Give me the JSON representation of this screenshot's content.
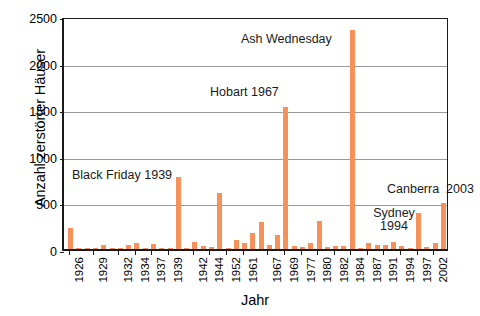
{
  "chart_data": {
    "type": "bar",
    "title": "",
    "xlabel": "Jahr",
    "ylabel": "Anzahl zerstörter Häuser",
    "ylim": [
      0,
      2500
    ],
    "ytick_values": [
      0,
      500,
      1000,
      1500,
      2000,
      2500
    ],
    "ytick_labels": [
      "0",
      "500",
      "1000",
      "1500",
      "2000",
      "2500"
    ],
    "grid": "horizontal",
    "legend": "none",
    "bar_color": "#F5915B",
    "xtick_labels": [
      "1926",
      "1929",
      "1932",
      "1934",
      "1937",
      "1939",
      "1942",
      "1944",
      "1952",
      "1961",
      "1967",
      "1969",
      "1977",
      "1980",
      "1982",
      "1984",
      "1987",
      "1991",
      "1994",
      "1997",
      "2002"
    ],
    "categories": [
      "1926",
      "1927",
      "1928",
      "1929",
      "1930",
      "1931",
      "1932",
      "1933",
      "1934",
      "1935",
      "1937",
      "1938",
      "1939",
      "1940",
      "1941",
      "1942",
      "1943",
      "1944",
      "1951",
      "1952",
      "1957",
      "1961",
      "1962",
      "1965",
      "1967",
      "1968",
      "1969",
      "1974",
      "1977",
      "1978",
      "1980",
      "1981",
      "1982",
      "1983",
      "1984",
      "1985",
      "1987",
      "1988",
      "1991",
      "1992",
      "1994",
      "1995",
      "1997",
      "1998",
      "2002",
      "2003"
    ],
    "values": [
      230,
      10,
      5,
      12,
      40,
      8,
      10,
      45,
      60,
      12,
      50,
      8,
      5,
      775,
      15,
      70,
      30,
      20,
      600,
      10,
      95,
      60,
      175,
      290,
      45,
      155,
      1520,
      30,
      25,
      60,
      300,
      20,
      30,
      35,
      2350,
      15,
      65,
      40,
      45,
      75,
      30,
      15,
      390,
      20,
      60,
      490
    ],
    "annotations": [
      {
        "text": "Black Friday 1939",
        "value": 775,
        "year": "1939"
      },
      {
        "text": "Hobart 1967",
        "value": 1520,
        "year": "1967"
      },
      {
        "text": "Ash Wednesday",
        "value": 2350,
        "year": "1983"
      },
      {
        "text": "Sydney\n1994",
        "value": 390,
        "year": "1994"
      },
      {
        "text": "Canberra  2003",
        "value": 490,
        "year": "2003"
      }
    ]
  },
  "labels": {
    "y_axis_title": "Anzahl zerstörter Häuser",
    "x_axis_title": "Jahr",
    "annotation_black_friday": "Black Friday 1939",
    "annotation_hobart": "Hobart 1967",
    "annotation_ash_wednesday": "Ash Wednesday",
    "annotation_sydney_line1": "Sydney",
    "annotation_sydney_line2": "1994",
    "annotation_canberra": "Canberra  2003"
  }
}
